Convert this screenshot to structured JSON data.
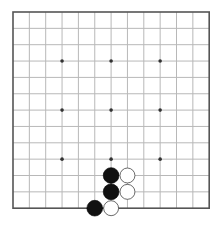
{
  "board": {
    "size": 13,
    "origin_x": 13,
    "origin_y": 12,
    "spacing": 16.35,
    "line_color": "#b8b8b8",
    "border_color": "#555555",
    "star_color": "#333333",
    "star_points": [
      [
        3,
        3
      ],
      [
        6,
        3
      ],
      [
        9,
        3
      ],
      [
        3,
        6
      ],
      [
        6,
        6
      ],
      [
        9,
        6
      ],
      [
        3,
        9
      ],
      [
        6,
        9
      ],
      [
        9,
        9
      ]
    ],
    "stones": [
      {
        "color": "black",
        "col": 6,
        "row": 10
      },
      {
        "color": "white",
        "col": 7,
        "row": 10
      },
      {
        "color": "black",
        "col": 6,
        "row": 11
      },
      {
        "color": "white",
        "col": 7,
        "row": 11
      },
      {
        "color": "black",
        "col": 5,
        "row": 12
      },
      {
        "color": "white",
        "col": 6,
        "row": 12
      }
    ]
  }
}
